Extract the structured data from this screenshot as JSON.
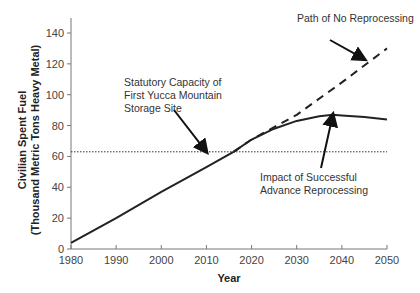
{
  "chart_data": {
    "type": "line",
    "title": "",
    "xlabel": "Year",
    "ylabel": "Civilian Spent Fuel (Thousand Metric Tons Heavy Metal)",
    "ylabel_lines": [
      "Civilian Spent Fuel",
      "(Thousand Metric Tons Heavy Metal)"
    ],
    "xlim": [
      1980,
      2050
    ],
    "ylim": [
      0,
      150
    ],
    "x_ticks": [
      1980,
      1990,
      2000,
      2010,
      2020,
      2030,
      2040,
      2050
    ],
    "y_ticks": [
      0,
      20,
      40,
      60,
      80,
      100,
      120,
      140
    ],
    "grid": false,
    "series": [
      {
        "name": "Historical / Impact of Successful Advance Reprocessing",
        "style": "solid",
        "x": [
          1980,
          1990,
          2000,
          2010,
          2016,
          2020,
          2025,
          2030,
          2035,
          2038,
          2040,
          2045,
          2050
        ],
        "y": [
          4,
          20,
          37,
          53,
          63,
          71,
          78,
          83,
          86,
          87,
          86.5,
          85.5,
          84
        ]
      },
      {
        "name": "Path of No Reprocessing",
        "style": "dashed",
        "x": [
          2016,
          2020,
          2030,
          2040,
          2050
        ],
        "y": [
          63,
          71,
          87,
          108,
          130
        ]
      },
      {
        "name": "Statutory Capacity of First Yucca Mountain Storage Site",
        "style": "dotted",
        "x": [
          1980,
          2050
        ],
        "y": [
          63,
          63
        ]
      }
    ],
    "annotations": [
      {
        "text": [
          "Path of No Reprocessing"
        ],
        "arrow_to": [
          2045,
          123
        ]
      },
      {
        "text": [
          "Statutory Capacity of",
          "First Yucca Mountain",
          "Storage Site"
        ],
        "arrow_to": [
          2010,
          63
        ]
      },
      {
        "text": [
          "Impact of Successful",
          "Advance Reprocessing"
        ],
        "arrow_to": [
          2038,
          87
        ]
      }
    ]
  }
}
